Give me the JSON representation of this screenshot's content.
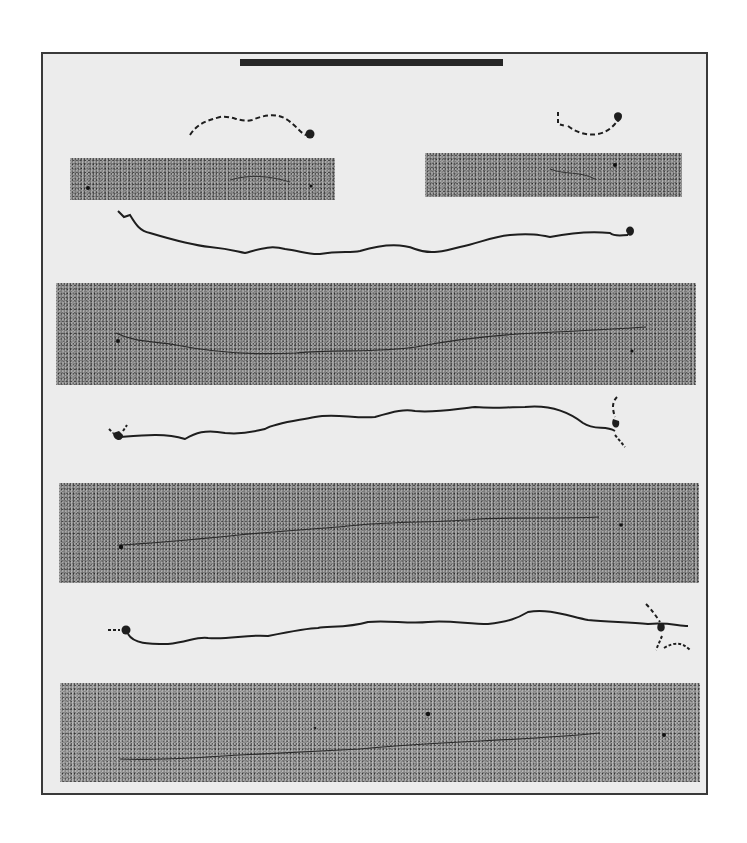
{
  "figure": {
    "type": "electron micrograph plate with tracings",
    "colors": {
      "background": "#ececec",
      "frame": "#3a3a3a",
      "micrograph": "#7d7d7d",
      "trace": "#1e1e1e"
    },
    "scale_bar": {
      "label": ""
    },
    "panels": [
      {
        "id": "top-left",
        "tracing_style": "dashed",
        "end_marker": "filled-circle-right"
      },
      {
        "id": "top-right",
        "tracing_style": "dashed",
        "end_marker": "forked-knob-right"
      },
      {
        "id": "row-1",
        "tracing_style": "solid",
        "end_marker": "forked-knob-right"
      },
      {
        "id": "row-2",
        "tracing_style": "solid",
        "end_marker": "forked-knobs-both-ends"
      },
      {
        "id": "row-3",
        "tracing_style": "solid",
        "end_marker": "knobs-with-dashed-tails"
      }
    ]
  }
}
